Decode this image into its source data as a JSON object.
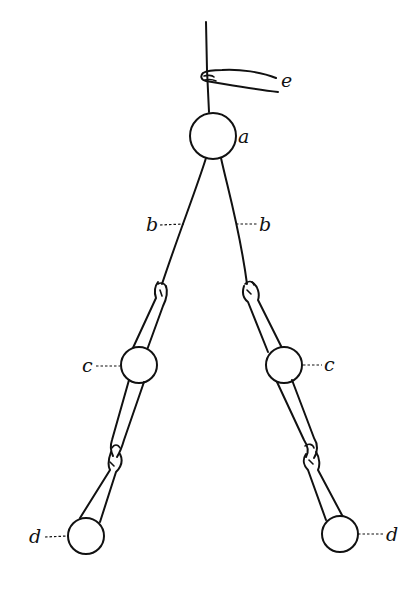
{
  "diagram": {
    "labels": {
      "a": "a",
      "b_left": "b",
      "b_right": "b",
      "c_left": "c",
      "c_right": "c",
      "d_left": "d",
      "d_right": "d",
      "e": "e"
    },
    "stroke_color": "#111111",
    "background_color": "#ffffff"
  }
}
